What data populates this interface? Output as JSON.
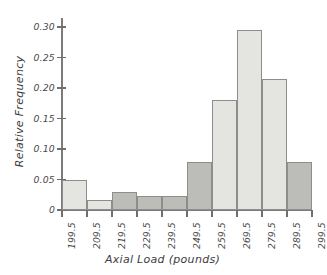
{
  "chart_data": {
    "type": "bar",
    "title": "",
    "subtitle": "",
    "xlabel": "Axial Load (pounds)",
    "ylabel": "Relative Frequency",
    "grid": false,
    "legend": "none",
    "orientation": "vertical",
    "note": "Histogram: bars span between consecutive class boundaries; tick labels sit at bin edges.",
    "bin_edges": [
      199.5,
      209.5,
      219.5,
      229.5,
      239.5,
      249.5,
      259.5,
      269.5,
      279.5,
      289.5,
      299.5
    ],
    "categories": [
      "199.5-209.5",
      "209.5-219.5",
      "219.5-229.5",
      "229.5-239.5",
      "239.5-249.5",
      "249.5-259.5",
      "259.5-269.5",
      "269.5-279.5",
      "279.5-289.5",
      "289.5-299.5"
    ],
    "values": [
      0.05,
      0.017,
      0.029,
      0.023,
      0.023,
      0.078,
      0.181,
      0.296,
      0.215,
      0.078
    ],
    "bar_shades": [
      "light",
      "light",
      "dark",
      "dark",
      "dark",
      "dark",
      "light",
      "light",
      "light",
      "dark"
    ],
    "xlim": [
      199.5,
      299.5
    ],
    "ylim": [
      0,
      0.315
    ],
    "ytick_values": [
      0,
      0.05,
      0.1,
      0.15,
      0.2,
      0.25,
      0.3
    ],
    "ytick_labels": [
      "0",
      "0.05",
      "0.10",
      "0.15",
      "0.20",
      "0.25",
      "0.30"
    ],
    "xtick_labels": [
      "199.5",
      "209.5",
      "219.5",
      "229.5",
      "239.5",
      "249.5",
      "259.5",
      "269.5",
      "279.5",
      "289.5",
      "299.5"
    ],
    "colors": {
      "bar_light": "#e4e4e1",
      "bar_dark": "#bcbcb9",
      "bar_edge": "#8d8d8a",
      "axis": "#7b7b7b",
      "text": "#3d3d3d",
      "background": "#ffffff"
    }
  }
}
